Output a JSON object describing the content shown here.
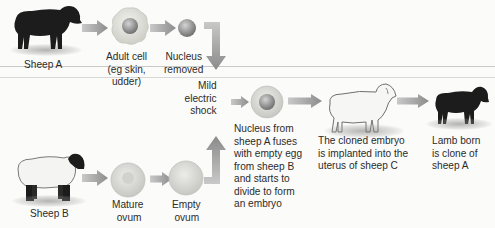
{
  "diagram": {
    "colors": {
      "arrow": "#9a9a9a",
      "cell_fill": "#d9d9d4",
      "nucleus": "#8f8f8f",
      "black_sheep": "#1c1c1c",
      "white_sheep": "#f4f4f2"
    },
    "nodes": {
      "sheep_a": {
        "label": "Sheep A",
        "icon": "black-sheep-icon"
      },
      "adult_cell": {
        "label_lines": [
          "Adult cell",
          "(eg skin,",
          "udder)"
        ],
        "icon": "adult-cell-icon"
      },
      "nucleus_removed": {
        "label_lines": [
          "Nucleus",
          "removed"
        ],
        "icon": "nucleus-icon"
      },
      "shock": {
        "label_lines": [
          "Mild",
          "electric",
          "shock"
        ]
      },
      "sheep_b": {
        "label": "Sheep B",
        "icon": "white-sheep-black-face-icon"
      },
      "mature_ovum": {
        "label_lines": [
          "Mature",
          "ovum"
        ],
        "icon": "ovum-icon"
      },
      "empty_ovum": {
        "label_lines": [
          "Empty",
          "ovum"
        ],
        "icon": "empty-ovum-icon"
      },
      "fused_egg": {
        "label_lines": [
          "Nucleus from",
          "sheep A fuses",
          "with empty egg",
          "from sheep B",
          "and starts to",
          "divide to form",
          "an embryo"
        ],
        "icon": "fused-egg-icon"
      },
      "sheep_c": {
        "label_lines": [
          "The cloned embryo",
          "is implanted into the",
          "uterus of sheep C"
        ],
        "icon": "white-sheep-icon"
      },
      "lamb": {
        "label_lines": [
          "Lamb born",
          "is clone of",
          "sheep A"
        ],
        "icon": "black-lamb-icon"
      }
    }
  }
}
